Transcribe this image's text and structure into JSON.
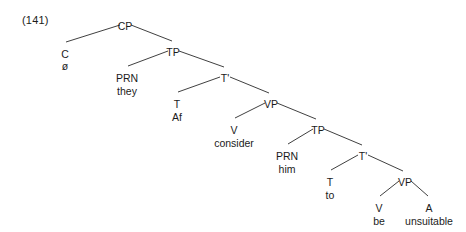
{
  "example": {
    "number": "(141)"
  },
  "diagram": {
    "type": "syntax-tree",
    "sentence": "they ø consider him to be unsuitable",
    "nodes": [
      {
        "id": "CP",
        "label": "CP",
        "x": 125,
        "y": 21
      },
      {
        "id": "C",
        "label": "C",
        "x": 65,
        "y": 49
      },
      {
        "id": "Cword",
        "label": "ø",
        "x": 65,
        "y": 61
      },
      {
        "id": "TP1",
        "label": "TP",
        "x": 173,
        "y": 47
      },
      {
        "id": "PRN1",
        "label": "PRN",
        "x": 127,
        "y": 73
      },
      {
        "id": "PRN1w",
        "label": "they",
        "x": 127,
        "y": 86
      },
      {
        "id": "Tbar1",
        "label": "T'",
        "x": 225,
        "y": 73
      },
      {
        "id": "T1",
        "label": "T",
        "x": 177,
        "y": 99
      },
      {
        "id": "T1word",
        "label": "Af",
        "x": 177,
        "y": 112
      },
      {
        "id": "VP1",
        "label": "VP",
        "x": 271,
        "y": 99
      },
      {
        "id": "V1",
        "label": "V",
        "x": 234,
        "y": 125
      },
      {
        "id": "V1word",
        "label": "consider",
        "x": 234,
        "y": 138
      },
      {
        "id": "TP2",
        "label": "TP",
        "x": 318,
        "y": 125
      },
      {
        "id": "PRN2",
        "label": "PRN",
        "x": 287,
        "y": 151
      },
      {
        "id": "PRN2w",
        "label": "him",
        "x": 287,
        "y": 164
      },
      {
        "id": "Tbar2",
        "label": "T'",
        "x": 363,
        "y": 151
      },
      {
        "id": "T2",
        "label": "T",
        "x": 330,
        "y": 177
      },
      {
        "id": "T2word",
        "label": "to",
        "x": 330,
        "y": 190
      },
      {
        "id": "VP2",
        "label": "VP",
        "x": 405,
        "y": 177
      },
      {
        "id": "V2",
        "label": "V",
        "x": 379,
        "y": 203
      },
      {
        "id": "V2word",
        "label": "be",
        "x": 379,
        "y": 216
      },
      {
        "id": "A1",
        "label": "A",
        "x": 429,
        "y": 203
      },
      {
        "id": "A1word",
        "label": "unsuitable",
        "x": 429,
        "y": 216
      }
    ],
    "edges": [
      {
        "from": "CP",
        "to": "C",
        "x1": 120,
        "y1": 25,
        "x2": 66,
        "y2": 42
      },
      {
        "from": "CP",
        "to": "TP1",
        "x1": 131,
        "y1": 25,
        "x2": 172,
        "y2": 41
      },
      {
        "from": "TP1",
        "to": "PRN1",
        "x1": 168,
        "y1": 51,
        "x2": 128,
        "y2": 66
      },
      {
        "from": "TP1",
        "to": "Tbar1",
        "x1": 179,
        "y1": 51,
        "x2": 224,
        "y2": 67
      },
      {
        "from": "Tbar1",
        "to": "T1",
        "x1": 220,
        "y1": 77,
        "x2": 178,
        "y2": 92
      },
      {
        "from": "Tbar1",
        "to": "VP1",
        "x1": 230,
        "y1": 77,
        "x2": 269,
        "y2": 93
      },
      {
        "from": "VP1",
        "to": "V1",
        "x1": 265,
        "y1": 103,
        "x2": 235,
        "y2": 118
      },
      {
        "from": "VP1",
        "to": "TP2",
        "x1": 277,
        "y1": 103,
        "x2": 316,
        "y2": 119
      },
      {
        "from": "TP2",
        "to": "PRN2",
        "x1": 313,
        "y1": 129,
        "x2": 288,
        "y2": 144
      },
      {
        "from": "TP2",
        "to": "Tbar2",
        "x1": 324,
        "y1": 129,
        "x2": 362,
        "y2": 145
      },
      {
        "from": "Tbar2",
        "to": "T2",
        "x1": 358,
        "y1": 155,
        "x2": 331,
        "y2": 170
      },
      {
        "from": "Tbar2",
        "to": "VP2",
        "x1": 368,
        "y1": 155,
        "x2": 403,
        "y2": 171
      },
      {
        "from": "VP2",
        "to": "V2",
        "x1": 399,
        "y1": 181,
        "x2": 380,
        "y2": 196
      },
      {
        "from": "VP2",
        "to": "A1",
        "x1": 411,
        "y1": 181,
        "x2": 428,
        "y2": 196
      }
    ]
  }
}
